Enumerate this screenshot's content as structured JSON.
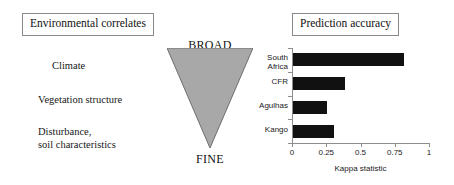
{
  "left_panel": {
    "heading": "Environmental correlates",
    "items": [
      {
        "label": "Climate"
      },
      {
        "label": "Vegetation structure"
      },
      {
        "label": "Disturbance,\nsoil characteristics"
      }
    ]
  },
  "scale_triangle": {
    "top_label": "BROAD",
    "bottom_label": "FINE",
    "fill_color": "#a8a8a8",
    "stroke_color": "#6e6e6e"
  },
  "right_panel": {
    "heading": "Prediction accuracy"
  },
  "chart_data": {
    "type": "bar",
    "orientation": "horizontal",
    "title": "Prediction accuracy",
    "categories": [
      "South\nAfrica",
      "CFR",
      "Agulhas",
      "Kango"
    ],
    "values": [
      0.81,
      0.38,
      0.25,
      0.3
    ],
    "xlabel": "Kappa statistic",
    "ylabel": "",
    "xlim": [
      0,
      1
    ],
    "xticks": [
      0,
      0.25,
      0.5,
      0.75,
      1
    ],
    "xtick_labels": [
      "0",
      "0.25",
      "0.5",
      "0.75",
      "1"
    ],
    "grid": false,
    "legend": false,
    "bar_color": "#111111",
    "axis_color": "#8d8d8d"
  }
}
